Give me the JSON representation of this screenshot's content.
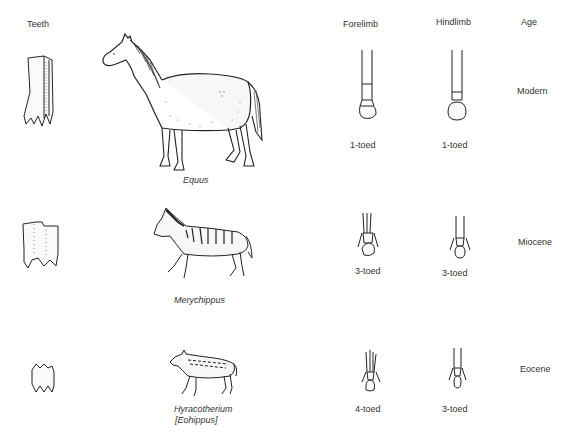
{
  "headers": {
    "teeth": "Teeth",
    "forelimb": "Forelimb",
    "hindlimb": "Hindlimb",
    "age": "Age"
  },
  "rows": [
    {
      "genus": "Equus",
      "genus_alt": "",
      "forelimb": "1-toed",
      "hindlimb": "1-toed",
      "age": "Modern"
    },
    {
      "genus": "Merychippus",
      "genus_alt": "",
      "forelimb": "3-toed",
      "hindlimb": "3-toed",
      "age": "Miocene"
    },
    {
      "genus": "Hyracotherium",
      "genus_alt": "[Eohippus]",
      "forelimb": "4-toed",
      "hindlimb": "3-toed",
      "age": "Eocene"
    }
  ]
}
